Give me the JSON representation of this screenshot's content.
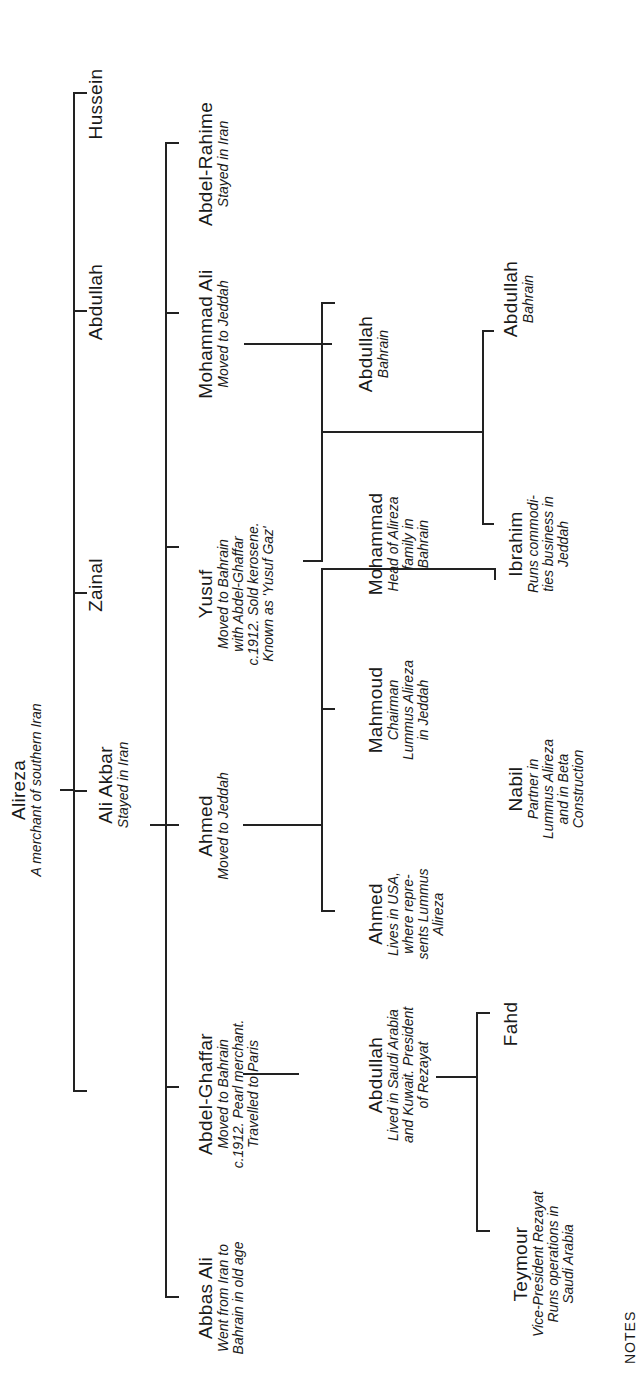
{
  "diagram": {
    "type": "family-tree",
    "orientation": "rotated-90-ccw",
    "root": {
      "name": "Alireza",
      "desc": "A merchant of southern Iran"
    },
    "generation1": [
      {
        "name": "Ali Akbar",
        "desc": "Stayed in Iran"
      },
      {
        "name": "Zainal",
        "desc": ""
      },
      {
        "name": "Abdullah",
        "desc": ""
      },
      {
        "name": "Hussein",
        "desc": ""
      }
    ],
    "generation2": [
      {
        "name": "Abbas Ali",
        "desc_lines": [
          "Went from Iran to",
          "Bahrain in old age"
        ]
      },
      {
        "name": "Abdel-Ghaffar",
        "desc_lines": [
          "Moved to Bahrain",
          "c.1912. Pearl merchant.",
          "Travelled to Paris"
        ]
      },
      {
        "name": "Ahmed",
        "desc_lines": [
          "Moved to Jeddah"
        ]
      },
      {
        "name": "Yusuf",
        "desc_lines": [
          "Moved to Bahrain",
          "with Abdel-Ghaffar",
          "c.1912. Sold kerosene.",
          "Known as 'Yusuf Gaz'"
        ]
      },
      {
        "name": "Mohammad Ali",
        "desc_lines": [
          "Moved to Jeddah"
        ]
      },
      {
        "name": "Abdel-Rahime",
        "desc_lines": [
          "Stayed in Iran"
        ]
      }
    ],
    "generation3": [
      {
        "name": "Abdullah",
        "parent": "Abdel-Ghaffar",
        "desc_lines": [
          "Lived in Saudi Arabia",
          "and Kuwait. President",
          "of Rezayat"
        ]
      },
      {
        "name": "Ahmed",
        "parent": "Ahmed",
        "desc_lines": [
          "Lives in USA,",
          "where repre-",
          "sents Lummus",
          "Alireza"
        ]
      },
      {
        "name": "Mahmoud",
        "parent": "Ahmed",
        "desc_lines": [
          "Chairman",
          "Lummus Alireza",
          "in Jeddah"
        ]
      },
      {
        "name": "Mohammad",
        "parent": "Yusuf",
        "desc_lines": [
          "Head of Alireza",
          "family in",
          "Bahrain"
        ]
      },
      {
        "name": "Abdullah",
        "parent": "Mohammad Ali",
        "desc_lines": [
          "Bahrain"
        ]
      }
    ],
    "generation4": [
      {
        "name": "Teymour",
        "parent": "Abdullah (son of Abdel-Ghaffar)",
        "desc_lines": [
          "Vice-President Rezayat",
          "Runs operations in",
          "Saudi Arabia"
        ]
      },
      {
        "name": "Fahd",
        "parent": "Abdullah (son of Abdel-Ghaffar)",
        "desc_lines": []
      },
      {
        "name": "Nabil",
        "parent": "Ahmed",
        "desc_lines": [
          "Partner in",
          "Lummus Alireza",
          "and in Beta",
          "Construction"
        ]
      },
      {
        "name": "Ibrahim",
        "parent": "Yusuf",
        "desc_lines": [
          "Runs commodi-",
          "ties business in",
          "Jeddah"
        ]
      },
      {
        "name": "Abdullah",
        "parent": "Yusuf",
        "desc_lines": [
          "Bahrain"
        ]
      }
    ],
    "footer_fragment": "NOTES"
  }
}
